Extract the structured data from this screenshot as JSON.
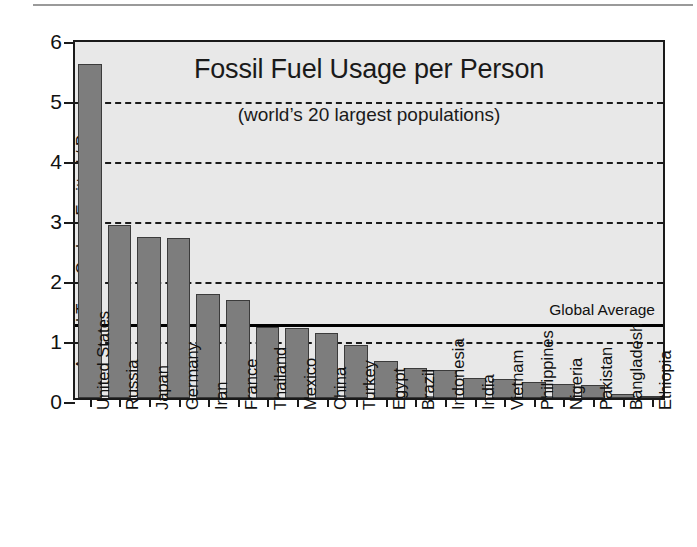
{
  "chart_data": {
    "type": "bar",
    "title": "Fossil Fuel Usage per Person",
    "subtitle": "(world’s 20 largest populations)",
    "xlabel": "",
    "ylabel": "Annual Tons Carbon Emitted / Person",
    "ylim": [
      0,
      6
    ],
    "yticks": [
      0,
      1,
      2,
      3,
      4,
      5,
      6
    ],
    "ytick_labels": [
      "0",
      "1",
      "2",
      "3",
      "4",
      "5",
      "6"
    ],
    "grid": true,
    "gridlines": [
      1,
      2,
      3,
      4,
      5
    ],
    "legend": null,
    "categories": [
      "United States",
      "Russia",
      "Japan",
      "Germany",
      "Iran",
      "France",
      "Thailand",
      "Mexico",
      "China",
      "Turkey",
      "Egypt",
      "Brazil",
      "Indonesia",
      "India",
      "Vietnam",
      "Philippines",
      "Nigeria",
      "Pakistan",
      "Bangladesh",
      "Ethiopia"
    ],
    "values": [
      5.57,
      2.88,
      2.69,
      2.67,
      1.73,
      1.63,
      1.18,
      1.17,
      1.08,
      0.88,
      0.61,
      0.5,
      0.47,
      0.33,
      0.32,
      0.26,
      0.23,
      0.21,
      0.06,
      0.02
    ],
    "annotations": [
      {
        "label": "Global Average",
        "y": 1.27,
        "type": "hline"
      }
    ],
    "colors": {
      "bar_fill": "#7d7d7d",
      "bar_edge": "#3b3b3b",
      "plot_background": "#e8e8e8",
      "axis": "#1a1a1a",
      "average_line": "#000000",
      "text": "#111111"
    }
  }
}
